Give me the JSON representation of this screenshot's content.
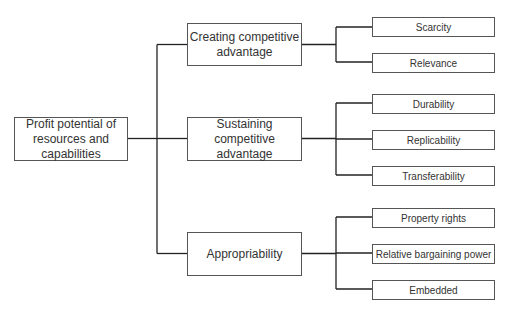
{
  "diagram": {
    "type": "tree",
    "root": {
      "label": "Profit potential of resources and capabilities",
      "lines": [
        "Profit potential of",
        "resources and",
        "capabilities"
      ]
    },
    "branches": [
      {
        "label": "Creating competitive advantage",
        "lines": [
          "Creating competitive",
          "advantage"
        ],
        "children": [
          "Scarcity",
          "Relevance"
        ]
      },
      {
        "label": "Sustaining competitive advantage",
        "lines": [
          "Sustaining",
          "competitive",
          "advantage"
        ],
        "children": [
          "Durability",
          "Replicability",
          "Transferability"
        ]
      },
      {
        "label": "Appropriability",
        "lines": [
          "Appropriability"
        ],
        "children": [
          "Property rights",
          "Relative bargaining power",
          "Embedded"
        ]
      }
    ]
  },
  "colors": {
    "line": "#222222",
    "border": "#555555",
    "text": "#333333"
  }
}
